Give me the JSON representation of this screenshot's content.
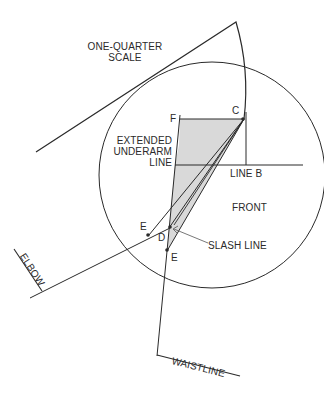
{
  "diagram": {
    "type": "pattern-drafting sleeve diagram",
    "colors": {
      "line": "#2a2a2a",
      "shade": "#d9d9d9",
      "background": "#ffffff"
    },
    "labels": {
      "scale_line1": "ONE-QUARTER",
      "scale_line2": "SCALE",
      "point_f": "F",
      "point_c": "C",
      "underarm_line1": "EXTENDED",
      "underarm_line2": "UNDERARM",
      "underarm_line3": "LINE",
      "line_b": "LINE B",
      "front": "FRONT",
      "point_e_left": "E",
      "point_d": "D",
      "slash_line": "SLASH LINE",
      "point_e_lower": "E",
      "elbow": "ELBOW",
      "waistline": "WAISTLINE"
    }
  }
}
